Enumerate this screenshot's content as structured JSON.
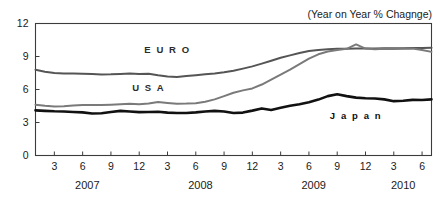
{
  "chart_data": {
    "type": "line",
    "title": "",
    "annotation": "(Year on Year % Chagnge)",
    "xlabel": "",
    "ylabel": "",
    "ylim": [
      0,
      12
    ],
    "y_ticks": [
      0,
      3,
      6,
      9,
      12
    ],
    "grid": false,
    "legend": "inline-labels",
    "x_tick_labels": [
      "3",
      "6",
      "9",
      "12",
      "3",
      "6",
      "9",
      "12",
      "3",
      "6",
      "9",
      "12",
      "3",
      "6"
    ],
    "x_tick_months": [
      3,
      6,
      9,
      12,
      3,
      6,
      9,
      12,
      3,
      6,
      9,
      12,
      3,
      6
    ],
    "year_labels": [
      "2007",
      "2008",
      "2009",
      "2010"
    ],
    "x": [
      "2007-01",
      "2007-02",
      "2007-03",
      "2007-04",
      "2007-05",
      "2007-06",
      "2007-07",
      "2007-08",
      "2007-09",
      "2007-10",
      "2007-11",
      "2007-12",
      "2008-01",
      "2008-02",
      "2008-03",
      "2008-04",
      "2008-05",
      "2008-06",
      "2008-07",
      "2008-08",
      "2008-09",
      "2008-10",
      "2008-11",
      "2008-12",
      "2009-01",
      "2009-02",
      "2009-03",
      "2009-04",
      "2009-05",
      "2009-06",
      "2009-07",
      "2009-08",
      "2009-09",
      "2009-10",
      "2009-11",
      "2009-12",
      "2010-01",
      "2010-02",
      "2010-03",
      "2010-04",
      "2010-05",
      "2010-06",
      "2010-07"
    ],
    "series": [
      {
        "name": "EURO",
        "color": "#555555",
        "width": 2.0,
        "label_x": "2008-03",
        "label_y": 9.3,
        "values": [
          7.8,
          7.62,
          7.5,
          7.45,
          7.46,
          7.44,
          7.4,
          7.36,
          7.38,
          7.42,
          7.46,
          7.4,
          7.44,
          7.3,
          7.18,
          7.14,
          7.22,
          7.3,
          7.38,
          7.46,
          7.56,
          7.7,
          7.9,
          8.1,
          8.35,
          8.62,
          8.88,
          9.1,
          9.32,
          9.5,
          9.6,
          9.66,
          9.7,
          9.7,
          9.72,
          9.72,
          9.72,
          9.74,
          9.74,
          9.76,
          9.78,
          9.78,
          9.8
        ]
      },
      {
        "name": "USA",
        "color": "#7a7a7a",
        "width": 2.0,
        "label_x": "2008-01",
        "label_y": 5.9,
        "values": [
          4.62,
          4.52,
          4.46,
          4.48,
          4.54,
          4.58,
          4.6,
          4.58,
          4.62,
          4.66,
          4.7,
          4.66,
          4.72,
          4.86,
          4.78,
          4.7,
          4.72,
          4.76,
          4.88,
          5.1,
          5.4,
          5.7,
          5.92,
          6.1,
          6.45,
          6.9,
          7.35,
          7.8,
          8.3,
          8.8,
          9.2,
          9.45,
          9.6,
          9.7,
          10.1,
          9.72,
          9.66,
          9.7,
          9.68,
          9.7,
          9.72,
          9.6,
          9.42
        ]
      },
      {
        "name": "Japan",
        "color": "#111111",
        "width": 2.6,
        "label_x": "2009-11",
        "label_y": 3.35,
        "values": [
          4.1,
          4.06,
          4.02,
          4.0,
          3.96,
          3.92,
          3.82,
          3.84,
          3.96,
          4.06,
          4.0,
          3.94,
          3.96,
          3.98,
          3.9,
          3.86,
          3.86,
          3.92,
          4.0,
          4.06,
          4.0,
          3.86,
          3.9,
          4.08,
          4.28,
          4.14,
          4.34,
          4.52,
          4.66,
          4.84,
          5.08,
          5.4,
          5.56,
          5.4,
          5.26,
          5.2,
          5.18,
          5.1,
          4.94,
          4.98,
          5.06,
          5.04,
          5.1
        ]
      }
    ]
  }
}
